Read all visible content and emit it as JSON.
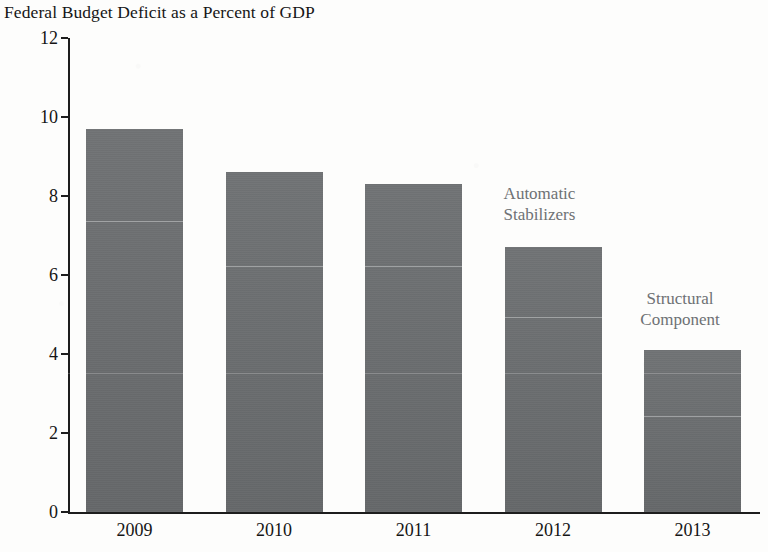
{
  "chart_data": {
    "type": "bar",
    "title": "Federal Budget Deficit as a Percent of GDP",
    "xlabel": "",
    "ylabel": "",
    "ylim": [
      0,
      12
    ],
    "ytick_values": [
      12,
      10,
      8,
      6,
      4,
      2,
      0
    ],
    "ytick_labels": [
      "12",
      "10",
      "8",
      "6",
      "4",
      "2",
      "0"
    ],
    "categories": [
      "2009",
      "2010",
      "2011",
      "2012",
      "2013"
    ],
    "stacked": true,
    "grid": false,
    "legend_position": "inline-annotations",
    "series": [
      {
        "name": "Structural Component",
        "values": [
          7.35,
          6.2,
          6.2,
          4.9,
          2.4
        ]
      },
      {
        "name": "Automatic Stabilizers",
        "values": [
          2.35,
          2.4,
          2.1,
          1.8,
          1.7
        ]
      }
    ],
    "totals": [
      9.7,
      8.6,
      8.3,
      6.7,
      4.1
    ],
    "annotations": [
      {
        "id": "automatic-stabilizers",
        "line1": "Automatic",
        "line2": "Stabilizers"
      },
      {
        "id": "structural-component",
        "line1": "Structural",
        "line2": "Component"
      }
    ],
    "colors": {
      "bar": "#6a6d6f",
      "divider": "#bec0c1",
      "axis": "#1d1d1d",
      "text": "#151515",
      "annotation_text": "#6e7174",
      "background": "#fdfdfc"
    }
  }
}
